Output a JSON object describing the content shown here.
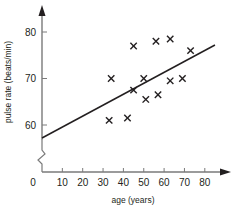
{
  "chart_data": {
    "type": "scatter",
    "title": "",
    "xlabel": "age (years)",
    "ylabel": "pulse rate (beats/min)",
    "xlim": [
      0,
      90
    ],
    "ylim": [
      55,
      85
    ],
    "x_ticks": [
      0,
      10,
      20,
      30,
      40,
      50,
      60,
      70,
      80
    ],
    "x_tick_labels": [
      "0",
      "10",
      "20",
      "30",
      "40",
      "50",
      "60",
      "70",
      "80"
    ],
    "y_ticks": [
      60,
      70,
      80
    ],
    "y_tick_labels": [
      "60",
      "70",
      "80"
    ],
    "y_axis_break": true,
    "grid": false,
    "marker": "x",
    "series": [
      {
        "name": "data",
        "points": [
          {
            "x": 33,
            "y": 61
          },
          {
            "x": 34,
            "y": 70
          },
          {
            "x": 42,
            "y": 61.5
          },
          {
            "x": 45,
            "y": 77
          },
          {
            "x": 45,
            "y": 67.5
          },
          {
            "x": 50,
            "y": 70
          },
          {
            "x": 51,
            "y": 65.5
          },
          {
            "x": 56,
            "y": 78
          },
          {
            "x": 57,
            "y": 66.5
          },
          {
            "x": 63,
            "y": 78.5
          },
          {
            "x": 63,
            "y": 69.5
          },
          {
            "x": 69,
            "y": 70
          },
          {
            "x": 73,
            "y": 76
          }
        ]
      }
    ],
    "line_of_best_fit": {
      "x": [
        0,
        85
      ],
      "y": [
        57.2,
        77.2
      ]
    },
    "colors": {
      "axis": "#7a7a7a",
      "ink": "#231f20"
    }
  }
}
